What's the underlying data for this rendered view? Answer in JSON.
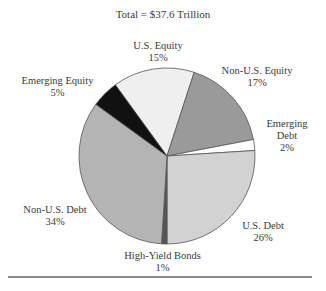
{
  "chart_data": {
    "type": "pie",
    "title": "Total = $37.6 Trillion",
    "slices": [
      {
        "label": "U.S. Equity",
        "pct_label": "15%",
        "value": 15,
        "color": "#efefef"
      },
      {
        "label": "Non-U.S. Equity",
        "pct_label": "17%",
        "value": 17,
        "color": "#9a9a9a"
      },
      {
        "label": "Emerging Debt",
        "label_lines": [
          "Emerging",
          "Debt"
        ],
        "pct_label": "2%",
        "value": 2,
        "color": "#ffffff"
      },
      {
        "label": "U.S. Debt",
        "pct_label": "26%",
        "value": 26,
        "color": "#d2d2d2"
      },
      {
        "label": "High-Yield Bonds",
        "pct_label": "1%",
        "value": 1,
        "color": "#555555"
      },
      {
        "label": "Non-U.S. Debt",
        "pct_label": "34%",
        "value": 34,
        "color": "#b4b4b4"
      },
      {
        "label": "Emerging Equity",
        "pct_label": "5%",
        "value": 5,
        "color": "#111111"
      }
    ],
    "start_angle_deg": -36,
    "units": "percent of total"
  },
  "labels": {
    "us_equity": {
      "name": "U.S. Equity",
      "pct": "15%"
    },
    "non_us_equity": {
      "name": "Non-U.S. Equity",
      "pct": "17%"
    },
    "emerging_debt": {
      "line1": "Emerging",
      "line2": "Debt",
      "pct": "2%"
    },
    "us_debt": {
      "name": "U.S. Debt",
      "pct": "26%"
    },
    "high_yield": {
      "name": "High-Yield Bonds",
      "pct": "1%"
    },
    "non_us_debt": {
      "name": "Non-U.S. Debt",
      "pct": "34%"
    },
    "emerging_equity": {
      "name": "Emerging Equity",
      "pct": "5%"
    }
  }
}
